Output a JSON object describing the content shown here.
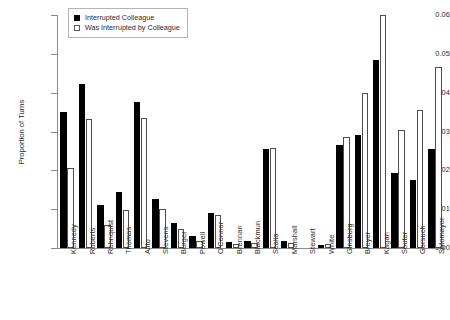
{
  "chart_data": {
    "type": "bar",
    "title": "",
    "xlabel": "",
    "ylabel": "Proportion of Turns",
    "ylim": [
      0,
      0.06
    ],
    "yticks": [
      "0.00",
      "0.01",
      "0.02",
      "0.03",
      "0.04",
      "0.05",
      "0.06"
    ],
    "ytick_values": [
      0,
      0.01,
      0.02,
      0.03,
      0.04,
      0.05,
      0.06
    ],
    "grid": false,
    "legend_position": "top-left",
    "categories": [
      "Kennedy",
      "Roberts",
      "Rehnquist",
      "Thomas",
      "Alito",
      "Stevens",
      "Burger",
      "Powell",
      "O'Connor",
      "Brennan",
      "Blackmun",
      "Scalia",
      "Marshall",
      "Stewart",
      "White",
      "Ginsburg",
      "Breyer",
      "Kagan",
      "Souter",
      "Gorsuch",
      "Sotomayor"
    ],
    "series": [
      {
        "name": "Interrupted Colleague",
        "style": "filled",
        "color": "#000000",
        "values": [
          0.035,
          0.0422,
          0.011,
          0.0145,
          0.0375,
          0.0125,
          0.0065,
          0.003,
          0.009,
          0.0016,
          0.0018,
          0.0255,
          0.0018,
          0.0,
          0.0008,
          0.0265,
          0.029,
          0.0485,
          0.0192,
          0.0175,
          0.0255
        ]
      },
      {
        "name": "Was Interrupted by Colleague",
        "style": "hollow",
        "color": "#ffffff",
        "values": [
          0.0205,
          0.0332,
          0.0058,
          0.0098,
          0.0335,
          0.01,
          0.0048,
          0.0018,
          0.0085,
          0.001,
          0.0013,
          0.0258,
          0.0013,
          0.0,
          0.001,
          0.0285,
          0.04,
          0.06,
          0.0305,
          0.0355,
          0.0465
        ]
      }
    ]
  },
  "legend": {
    "items": [
      {
        "label": "Interrupted Colleague",
        "style": "filled"
      },
      {
        "label": "Was Interrupted by Colleague",
        "style": "hollow"
      }
    ]
  }
}
